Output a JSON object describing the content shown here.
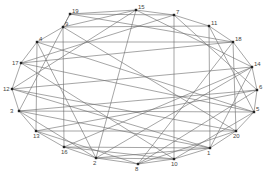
{
  "graph": {
    "nodes": [
      {
        "id": "1",
        "x": 210,
        "y": 148
      },
      {
        "id": "2",
        "x": 96,
        "y": 158
      },
      {
        "id": "3",
        "x": 19,
        "y": 111
      },
      {
        "id": "4",
        "x": 37,
        "y": 42
      },
      {
        "id": "5",
        "x": 254,
        "y": 112
      },
      {
        "id": "6",
        "x": 257,
        "y": 90
      },
      {
        "id": "7",
        "x": 174,
        "y": 15
      },
      {
        "id": "8",
        "x": 138,
        "y": 164
      },
      {
        "id": "9",
        "x": 63,
        "y": 27
      },
      {
        "id": "10",
        "x": 174,
        "y": 159
      },
      {
        "id": "11",
        "x": 209,
        "y": 26
      },
      {
        "id": "12",
        "x": 12,
        "y": 89
      },
      {
        "id": "13",
        "x": 36,
        "y": 131
      },
      {
        "id": "14",
        "x": 252,
        "y": 67
      },
      {
        "id": "15",
        "x": 136,
        "y": 10
      },
      {
        "id": "16",
        "x": 64,
        "y": 147
      },
      {
        "id": "17",
        "x": 21,
        "y": 63
      },
      {
        "id": "18",
        "x": 233,
        "y": 42
      },
      {
        "id": "19",
        "x": 70,
        "y": 14
      },
      {
        "id": "20",
        "x": 236,
        "y": 131
      }
    ],
    "edges": [
      [
        "19",
        "15"
      ],
      [
        "15",
        "7"
      ],
      [
        "7",
        "11"
      ],
      [
        "11",
        "18"
      ],
      [
        "18",
        "14"
      ],
      [
        "14",
        "6"
      ],
      [
        "6",
        "5"
      ],
      [
        "5",
        "20"
      ],
      [
        "20",
        "1"
      ],
      [
        "1",
        "10"
      ],
      [
        "10",
        "8"
      ],
      [
        "8",
        "2"
      ],
      [
        "2",
        "16"
      ],
      [
        "16",
        "13"
      ],
      [
        "13",
        "3"
      ],
      [
        "3",
        "12"
      ],
      [
        "12",
        "17"
      ],
      [
        "17",
        "4"
      ],
      [
        "4",
        "9"
      ],
      [
        "9",
        "19"
      ],
      [
        "19",
        "7"
      ],
      [
        "9",
        "15"
      ],
      [
        "4",
        "18"
      ],
      [
        "17",
        "18"
      ],
      [
        "12",
        "14"
      ],
      [
        "3",
        "6"
      ],
      [
        "3",
        "5"
      ],
      [
        "13",
        "20"
      ],
      [
        "16",
        "1"
      ],
      [
        "2",
        "10"
      ],
      [
        "2",
        "1"
      ],
      [
        "8",
        "20"
      ],
      [
        "10",
        "5"
      ],
      [
        "1",
        "14"
      ],
      [
        "20",
        "18"
      ],
      [
        "5",
        "11"
      ],
      [
        "6",
        "7"
      ],
      [
        "14",
        "15"
      ],
      [
        "18",
        "19"
      ],
      [
        "11",
        "9"
      ],
      [
        "15",
        "2"
      ],
      [
        "7",
        "10"
      ],
      [
        "9",
        "16"
      ],
      [
        "4",
        "13"
      ],
      [
        "11",
        "1"
      ],
      [
        "12",
        "20"
      ],
      [
        "17",
        "5"
      ],
      [
        "3",
        "1"
      ],
      [
        "13",
        "8"
      ],
      [
        "16",
        "10"
      ],
      [
        "19",
        "3"
      ],
      [
        "15",
        "12"
      ],
      [
        "4",
        "2"
      ],
      [
        "7",
        "17"
      ],
      [
        "14",
        "2"
      ],
      [
        "6",
        "13"
      ],
      [
        "18",
        "8"
      ],
      [
        "20",
        "9"
      ],
      [
        "5",
        "4"
      ],
      [
        "1",
        "12"
      ],
      [
        "10",
        "17"
      ],
      [
        "8",
        "6"
      ],
      [
        "2",
        "3"
      ],
      [
        "16",
        "14"
      ]
    ]
  }
}
